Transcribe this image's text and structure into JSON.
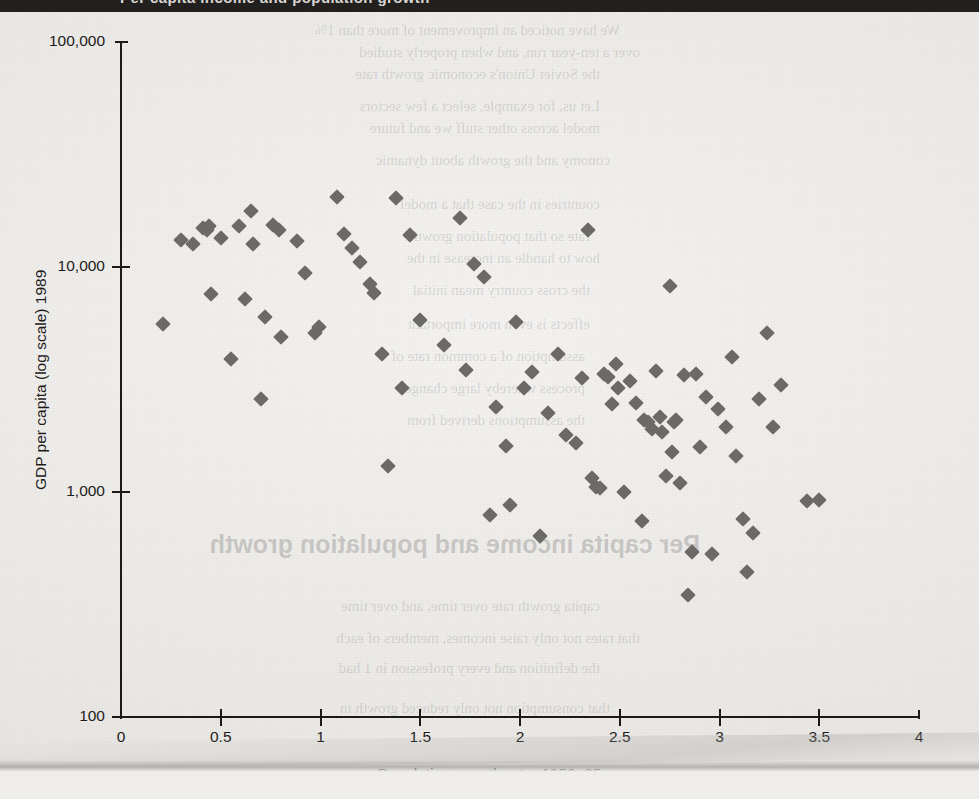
{
  "page": {
    "top_band_clipped_text": "Per capita income and population growth",
    "background_color": "#eeeeec",
    "marker_color": "#6c6a68",
    "axis_color": "#1c1a19"
  },
  "ghost_text": [
    {
      "text": "We have noticed an improvement of more than 1%",
      "x": 620,
      "y": 22,
      "size": 15,
      "big": false
    },
    {
      "text": "over a ten-year run, and when properly studied",
      "x": 640,
      "y": 44,
      "size": 15,
      "big": false
    },
    {
      "text": "the Soviet Union's economic growth rate",
      "x": 600,
      "y": 66,
      "size": 15,
      "big": false
    },
    {
      "text": "Let us, for example, select a few sectors",
      "x": 600,
      "y": 98,
      "size": 15,
      "big": false
    },
    {
      "text": "model across other stuff we and future",
      "x": 600,
      "y": 120,
      "size": 15,
      "big": false
    },
    {
      "text": "conomy and the growth about dynamic",
      "x": 610,
      "y": 152,
      "size": 15,
      "big": false
    },
    {
      "text": "countries in the case that a model",
      "x": 600,
      "y": 196,
      "size": 15,
      "big": false
    },
    {
      "text": "rate so that population growth",
      "x": 590,
      "y": 228,
      "size": 15,
      "big": false
    },
    {
      "text": "how to handle an increase in the",
      "x": 600,
      "y": 250,
      "size": 15,
      "big": false
    },
    {
      "text": "the cross country mean initial",
      "x": 590,
      "y": 282,
      "size": 15,
      "big": false
    },
    {
      "text": "effects is even more important",
      "x": 590,
      "y": 316,
      "size": 15,
      "big": false
    },
    {
      "text": "assumption of a common rate of",
      "x": 585,
      "y": 348,
      "size": 15,
      "big": false
    },
    {
      "text": "process whereby large changes",
      "x": 585,
      "y": 380,
      "size": 15,
      "big": false
    },
    {
      "text": "the assumptions derived from",
      "x": 585,
      "y": 412,
      "size": 15,
      "big": false
    },
    {
      "text": "Per capita income and population growth",
      "x": 700,
      "y": 530,
      "size": 25,
      "big": true
    },
    {
      "text": "capita growth rate over time, and over time",
      "x": 600,
      "y": 598,
      "size": 15,
      "big": false
    },
    {
      "text": "that rates not only raise incomes, members of each",
      "x": 640,
      "y": 630,
      "size": 15,
      "big": false
    },
    {
      "text": "the definition and every profession in 1 had",
      "x": 600,
      "y": 660,
      "size": 15,
      "big": false
    },
    {
      "text": "that consumption not only reduced growth in",
      "x": 610,
      "y": 700,
      "size": 15,
      "big": false
    }
  ],
  "chart_data": {
    "type": "scatter",
    "title": "",
    "xlabel": "Population growth rate, 1950–85",
    "ylabel": "GDP per capita (log scale) 1989",
    "x_ticks": [
      "0",
      "0.5",
      "1",
      "1.5",
      "2",
      "2.5",
      "3",
      "3.5",
      "4"
    ],
    "x_tick_values": [
      0,
      0.5,
      1,
      1.5,
      2,
      2.5,
      3,
      3.5,
      4
    ],
    "y_ticks": [
      "100,000",
      "10,000",
      "1,000",
      "100"
    ],
    "y_tick_values": [
      100000,
      10000,
      1000,
      100
    ],
    "xlim": [
      0,
      4
    ],
    "ylim": [
      100,
      100000
    ],
    "y_scale": "log",
    "grid": false,
    "legend": false,
    "marker": "diamond",
    "points": [
      [
        0.21,
        5600
      ],
      [
        0.3,
        13200
      ],
      [
        0.36,
        12600
      ],
      [
        0.41,
        14900
      ],
      [
        0.43,
        14600
      ],
      [
        0.44,
        15200
      ],
      [
        0.45,
        7600
      ],
      [
        0.5,
        13400
      ],
      [
        0.55,
        3900
      ],
      [
        0.59,
        15200
      ],
      [
        0.62,
        7200
      ],
      [
        0.65,
        17800
      ],
      [
        0.66,
        12600
      ],
      [
        0.7,
        2600
      ],
      [
        0.72,
        6000
      ],
      [
        0.76,
        15400
      ],
      [
        0.79,
        14600
      ],
      [
        0.8,
        4900
      ],
      [
        0.88,
        13000
      ],
      [
        0.92,
        9400
      ],
      [
        0.97,
        5100
      ],
      [
        0.99,
        5400
      ],
      [
        1.08,
        20500
      ],
      [
        1.12,
        14000
      ],
      [
        1.16,
        12100
      ],
      [
        1.2,
        10500
      ],
      [
        1.25,
        8400
      ],
      [
        1.27,
        7700
      ],
      [
        1.31,
        4100
      ],
      [
        1.34,
        1300
      ],
      [
        1.38,
        20200
      ],
      [
        1.41,
        2900
      ],
      [
        1.45,
        13900
      ],
      [
        1.5,
        5800
      ],
      [
        1.62,
        4500
      ],
      [
        1.7,
        16600
      ],
      [
        1.73,
        3500
      ],
      [
        1.77,
        10300
      ],
      [
        1.82,
        9000
      ],
      [
        1.85,
        790
      ],
      [
        1.88,
        2400
      ],
      [
        1.93,
        1600
      ],
      [
        1.95,
        880
      ],
      [
        1.98,
        5700
      ],
      [
        2.02,
        2900
      ],
      [
        2.06,
        3400
      ],
      [
        2.1,
        640
      ],
      [
        2.14,
        2250
      ],
      [
        2.19,
        4100
      ],
      [
        2.23,
        1800
      ],
      [
        2.28,
        1650
      ],
      [
        2.31,
        3200
      ],
      [
        2.34,
        14600
      ],
      [
        2.36,
        1150
      ],
      [
        2.38,
        1050
      ],
      [
        2.4,
        1040
      ],
      [
        2.42,
        3350
      ],
      [
        2.44,
        3250
      ],
      [
        2.46,
        2450
      ],
      [
        2.48,
        3700
      ],
      [
        2.49,
        2900
      ],
      [
        2.52,
        1000
      ],
      [
        2.55,
        3100
      ],
      [
        2.58,
        2500
      ],
      [
        2.61,
        740
      ],
      [
        2.62,
        2100
      ],
      [
        2.64,
        2050
      ],
      [
        2.66,
        1900
      ],
      [
        2.68,
        3450
      ],
      [
        2.7,
        2150
      ],
      [
        2.71,
        1850
      ],
      [
        2.73,
        1180
      ],
      [
        2.75,
        8200
      ],
      [
        2.76,
        1500
      ],
      [
        2.77,
        2050
      ],
      [
        2.78,
        2100
      ],
      [
        2.8,
        1100
      ],
      [
        2.82,
        3300
      ],
      [
        2.84,
        350
      ],
      [
        2.86,
        540
      ],
      [
        2.88,
        3350
      ],
      [
        2.9,
        1580
      ],
      [
        2.93,
        2650
      ],
      [
        2.96,
        530
      ],
      [
        2.99,
        2350
      ],
      [
        3.03,
        1950
      ],
      [
        3.06,
        4000
      ],
      [
        3.08,
        1450
      ],
      [
        3.12,
        760
      ],
      [
        3.14,
        440
      ],
      [
        3.17,
        660
      ],
      [
        3.2,
        2600
      ],
      [
        3.24,
        5100
      ],
      [
        3.27,
        1950
      ],
      [
        3.31,
        3000
      ],
      [
        3.44,
        910
      ],
      [
        3.5,
        920
      ]
    ]
  }
}
